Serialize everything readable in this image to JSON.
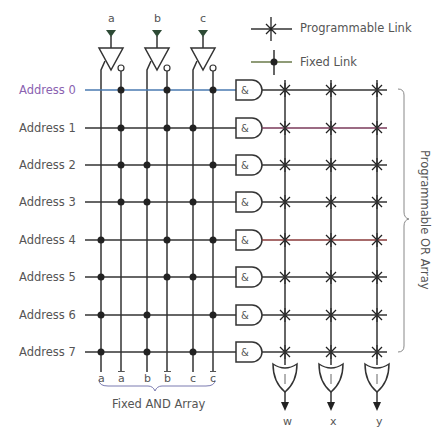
{
  "inputs": [
    "a",
    "b",
    "c"
  ],
  "legend": {
    "programmable": "Programmable Link",
    "fixed": "Fixed Link"
  },
  "addresses": [
    "Address 0",
    "Address 1",
    "Address 2",
    "Address 3",
    "Address 4",
    "Address 5",
    "Address 6",
    "Address 7"
  ],
  "column_labels": [
    "a",
    "a",
    "b",
    "b",
    "c",
    "c"
  ],
  "and_symbol": "&",
  "or_symbol": "|",
  "outputs": [
    "w",
    "x",
    "y"
  ],
  "fixed_and_label": "Fixed AND Array",
  "programmable_or_label": "Programmable OR Array",
  "fixed_links": [
    [
      1,
      3,
      5
    ],
    [
      1,
      3,
      4
    ],
    [
      1,
      2,
      5
    ],
    [
      1,
      2,
      4
    ],
    [
      0,
      3,
      5
    ],
    [
      0,
      3,
      4
    ],
    [
      0,
      2,
      5
    ],
    [
      0,
      2,
      4
    ]
  ],
  "colors": {
    "line": "#333333",
    "text": "#555555",
    "accent0": "#7a5aa6"
  }
}
